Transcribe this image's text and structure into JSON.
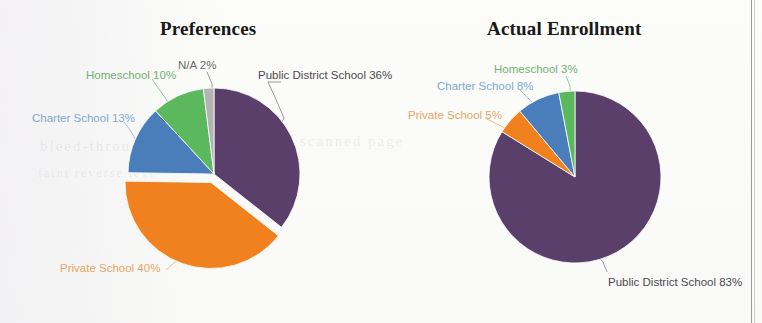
{
  "document": {
    "background_color": "#fdfdfc",
    "page_rule_color": "#9a9a9a",
    "bleed_text_1": "bleed-through",
    "bleed_text_2": "scanned page",
    "bleed_text_3": "faint reverse text"
  },
  "palette": {
    "public_district": "#5a3f6b",
    "private": "#f0811e",
    "charter": "#4a7ebb",
    "homeschool": "#5cb85c",
    "na": "#b3b3b3",
    "leader_line": "#9aa0a6",
    "title": "#191919"
  },
  "charts": [
    {
      "id": "preferences",
      "title": "Preferences",
      "labels": {
        "public": "Public District School 36%",
        "na": "N/A 2%",
        "homeschool": "Homeschool 10%",
        "charter": "Charter School 13%",
        "private": "Private School 40%"
      }
    },
    {
      "id": "actual-enrollment",
      "title": "Actual Enrollment",
      "labels": {
        "homeschool": "Homeschool 3%",
        "charter": "Charter School 8%",
        "private": "Private School 5%",
        "public": "Public District School 83%"
      }
    }
  ],
  "chart_data": [
    {
      "type": "pie",
      "title": "Preferences",
      "categories": [
        "Public District School",
        "Private School",
        "Charter School",
        "Homeschool",
        "N/A"
      ],
      "values": [
        36,
        40,
        13,
        10,
        2
      ],
      "value_suffix": "%",
      "colors": [
        "#5a3f6b",
        "#f0811e",
        "#4a7ebb",
        "#5cb85c",
        "#b3b3b3"
      ],
      "exploded": [
        "Private School"
      ],
      "start_angle_deg": 0,
      "direction": "clockwise",
      "legend": "none",
      "labels_position": "outside-with-leader-lines",
      "data_labels": [
        "Public District School 36%",
        "Private School 40%",
        "Charter School 13%",
        "Homeschool 10%",
        "N/A 2%"
      ]
    },
    {
      "type": "pie",
      "title": "Actual Enrollment",
      "categories": [
        "Public District School",
        "Private School",
        "Charter School",
        "Homeschool"
      ],
      "values": [
        83,
        5,
        8,
        3
      ],
      "value_suffix": "%",
      "colors": [
        "#5a3f6b",
        "#f0811e",
        "#4a7ebb",
        "#5cb85c"
      ],
      "exploded": [],
      "start_angle_deg": 0,
      "direction": "clockwise",
      "legend": "none",
      "labels_position": "outside-with-leader-lines",
      "data_labels": [
        "Public District School 83%",
        "Private School 5%",
        "Charter School 8%",
        "Homeschool 3%"
      ]
    }
  ]
}
